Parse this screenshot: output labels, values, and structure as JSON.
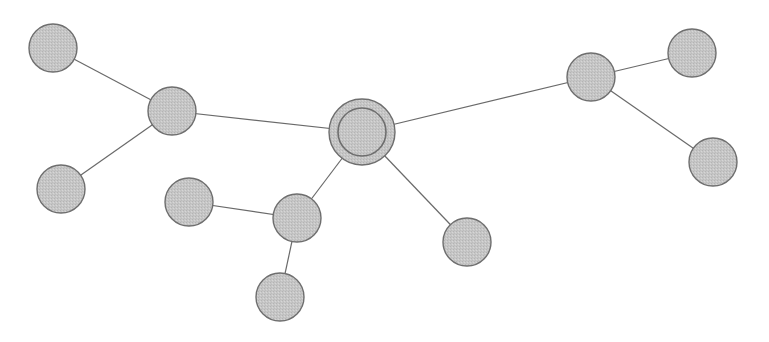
{
  "diagram": {
    "type": "network-graph",
    "colors": {
      "background": "#ffffff",
      "node_fill": "#c6c6c6",
      "node_stroke": "#6e6e6e",
      "edge": "#6a6a6a"
    },
    "nodes": [
      {
        "id": "center",
        "x": 362,
        "y": 132,
        "r": 33,
        "inner_r": 24,
        "role": "central"
      },
      {
        "id": "left-hub",
        "x": 172,
        "y": 111,
        "r": 24
      },
      {
        "id": "top-left",
        "x": 53,
        "y": 48,
        "r": 24
      },
      {
        "id": "bottom-left",
        "x": 61,
        "y": 189,
        "r": 24
      },
      {
        "id": "mid-hub",
        "x": 297,
        "y": 218,
        "r": 24
      },
      {
        "id": "mid-left",
        "x": 189,
        "y": 202,
        "r": 24
      },
      {
        "id": "bottom",
        "x": 280,
        "y": 297,
        "r": 24
      },
      {
        "id": "lower-right",
        "x": 467,
        "y": 242,
        "r": 24
      },
      {
        "id": "right-hub",
        "x": 591,
        "y": 77,
        "r": 24
      },
      {
        "id": "top-right",
        "x": 692,
        "y": 53,
        "r": 24
      },
      {
        "id": "far-right",
        "x": 713,
        "y": 162,
        "r": 24
      }
    ],
    "edges": [
      [
        "center",
        "left-hub"
      ],
      [
        "left-hub",
        "top-left"
      ],
      [
        "left-hub",
        "bottom-left"
      ],
      [
        "center",
        "mid-hub"
      ],
      [
        "mid-hub",
        "mid-left"
      ],
      [
        "mid-hub",
        "bottom"
      ],
      [
        "center",
        "lower-right"
      ],
      [
        "center",
        "right-hub"
      ],
      [
        "right-hub",
        "top-right"
      ],
      [
        "right-hub",
        "far-right"
      ]
    ]
  }
}
